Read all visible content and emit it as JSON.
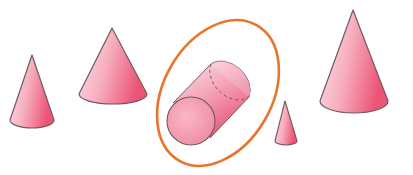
{
  "diagram": {
    "title": "Shapes: cones and a highlighted cylinder",
    "colors": {
      "fill_light": "#fbd3dc",
      "fill_dark": "#ee5f7c",
      "outline": "#6e5a63",
      "highlight_ring": "#e8742e",
      "background": "#ffffff"
    },
    "shapes": [
      {
        "id": "cone-1",
        "type": "cone",
        "label": "small cone"
      },
      {
        "id": "cone-2",
        "type": "cone",
        "label": "medium cone"
      },
      {
        "id": "cylinder",
        "type": "cylinder",
        "label": "cylinder",
        "highlighted": true
      },
      {
        "id": "cone-3",
        "type": "cone",
        "label": "tiny cone"
      },
      {
        "id": "cone-4",
        "type": "cone",
        "label": "large cone"
      }
    ],
    "highlight": {
      "shape": "cylinder",
      "style": "orange ellipse outline"
    }
  }
}
